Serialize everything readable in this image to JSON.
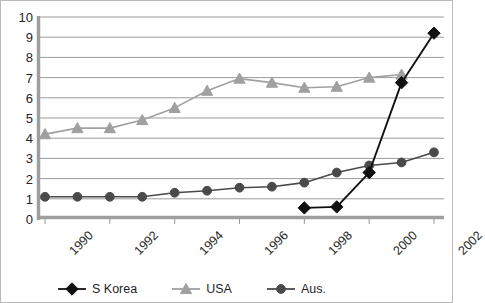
{
  "chart_data": {
    "type": "line",
    "title": "",
    "subtitle": "",
    "xlabel": "",
    "ylabel": "",
    "x": [
      1990,
      1991,
      1992,
      1993,
      1994,
      1995,
      1996,
      1997,
      1998,
      1999,
      2000,
      2001,
      2002
    ],
    "xlim": [
      1990,
      2002
    ],
    "ylim": [
      0,
      10
    ],
    "y_ticks": [
      0,
      1,
      2,
      3,
      4,
      5,
      6,
      7,
      8,
      9,
      10
    ],
    "x_ticks": [
      1990,
      1991,
      1992,
      1993,
      1994,
      1995,
      1996,
      1997,
      1998,
      1999,
      2000,
      2001,
      2002
    ],
    "x_tick_labels_shown": [
      "1990",
      "1992",
      "1994",
      "1996",
      "1998",
      "2000",
      "2002"
    ],
    "grid": "horizontal",
    "legend_position": "bottom",
    "series": [
      {
        "name": "S Korea",
        "marker": "diamond",
        "color": "#111111",
        "x": [
          1998,
          1999,
          2000,
          2001,
          2002
        ],
        "values": [
          0.55,
          0.6,
          2.3,
          6.75,
          9.2
        ]
      },
      {
        "name": "USA",
        "marker": "triangle",
        "color": "#a0a0a0",
        "x": [
          1990,
          1991,
          1992,
          1993,
          1994,
          1995,
          1996,
          1997,
          1998,
          1999,
          2000,
          2001
        ],
        "values": [
          4.2,
          4.5,
          4.5,
          4.9,
          5.5,
          6.35,
          6.95,
          6.75,
          6.5,
          6.55,
          7.0,
          7.15
        ]
      },
      {
        "name": "Aus.",
        "marker": "circle",
        "color": "#4a4a4a",
        "x": [
          1990,
          1991,
          1992,
          1993,
          1994,
          1995,
          1996,
          1997,
          1998,
          1999,
          2000,
          2001,
          2002
        ],
        "values": [
          1.1,
          1.1,
          1.1,
          1.1,
          1.3,
          1.4,
          1.55,
          1.6,
          1.8,
          2.3,
          2.65,
          2.8,
          3.3
        ]
      }
    ]
  },
  "axes": {
    "y_labels": [
      "10",
      "9",
      "8",
      "7",
      "6",
      "5",
      "4",
      "3",
      "2",
      "1",
      "0"
    ],
    "x_labels": [
      "1990",
      "1992",
      "1994",
      "1996",
      "1998",
      "2000",
      "2002"
    ]
  },
  "legend": {
    "items": [
      {
        "label": "S Korea",
        "color": "#111111",
        "marker": "diamond"
      },
      {
        "label": "USA",
        "color": "#a0a0a0",
        "marker": "triangle"
      },
      {
        "label": "Aus.",
        "color": "#4a4a4a",
        "marker": "circle"
      }
    ]
  },
  "colors": {
    "grid": "#9a9a9a",
    "axis": "#9e9e9e",
    "frame": "#b9b9b9",
    "background": "#ffffff",
    "text": "#262626"
  }
}
